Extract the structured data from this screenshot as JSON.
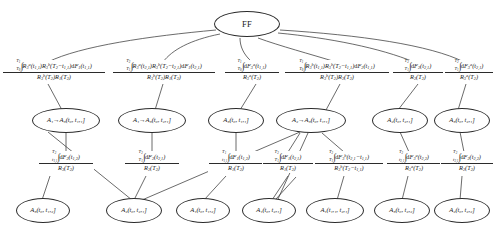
{
  "diagram": {
    "title": "FF",
    "type": "fault-tree",
    "canvas": {
      "width": 494,
      "height": 234
    },
    "colors": {
      "stroke": "#2b2b2b",
      "background": "#ffffff",
      "text": "#1a1a1a"
    },
    "root": {
      "id": "FF",
      "label": "FF",
      "x": 247,
      "y": 24,
      "w": 66,
      "h": 26
    },
    "nodes": [
      {
        "id": "n1",
        "label": "A₁→A₃(t₀, t₁,₁]",
        "x": 66,
        "y": 120,
        "w": 68,
        "h": 25,
        "row": "middle"
      },
      {
        "id": "n2",
        "label": "A₁→A₃(t₀, t₂,₁]",
        "x": 152,
        "y": 120,
        "w": 68,
        "h": 25,
        "row": "middle"
      },
      {
        "id": "n3",
        "label": "A₃(t₀, t₁,₁]",
        "x": 234,
        "y": 120,
        "w": 52,
        "h": 25,
        "row": "middle"
      },
      {
        "id": "n4",
        "label": "A₂→A₃(t₀, t₁,₁]",
        "x": 320,
        "y": 120,
        "w": 68,
        "h": 25,
        "row": "middle"
      },
      {
        "id": "n5",
        "label": "A₂(t₀, t₂,₁]",
        "x": 394,
        "y": 120,
        "w": 50,
        "h": 25,
        "row": "middle"
      },
      {
        "id": "n6",
        "label": "A₃(t₀, t₂,₁]",
        "x": 456,
        "y": 120,
        "w": 50,
        "h": 25,
        "row": "middle"
      },
      {
        "id": "b1",
        "label": "A₃(t₀, t₁,₂]",
        "x": 40,
        "y": 210,
        "w": 52,
        "h": 25,
        "row": "bottom"
      },
      {
        "id": "b2",
        "label": "A₂(t₀, t₂,₁]",
        "x": 130,
        "y": 210,
        "w": 52,
        "h": 25,
        "row": "bottom"
      },
      {
        "id": "b3",
        "label": "A₁(t₀, t₁,₂]",
        "x": 200,
        "y": 210,
        "w": 52,
        "h": 25,
        "row": "bottom"
      },
      {
        "id": "b4",
        "label": "A₁(t₀, t₂,₁]",
        "x": 268,
        "y": 210,
        "w": 52,
        "h": 25,
        "row": "bottom"
      },
      {
        "id": "b5",
        "label": "A₁(t₁,₁, t₂,₁]",
        "x": 335,
        "y": 210,
        "w": 56,
        "h": 25,
        "row": "bottom"
      },
      {
        "id": "b6",
        "label": "A₃(t₀, t₂,₂]",
        "x": 400,
        "y": 210,
        "w": 52,
        "h": 25,
        "row": "bottom"
      },
      {
        "id": "b7",
        "label": "A₂(t₀, t₂,₂]",
        "x": 460,
        "y": 210,
        "w": 52,
        "h": 25,
        "row": "bottom"
      }
    ],
    "edge_labels_top": [
      {
        "id": "f1",
        "numerator": "∫_{T₀}^{t_{T₁}} R₃ᵃ(t₁,₁) R₃ᵇ(T₂−t₁,₁) dF₁(t₁,₁)",
        "denominator": "R₃ᵇ(T₂) R₁(T₂)",
        "x": 48,
        "y": 73
      },
      {
        "id": "f2",
        "numerator": "∫_{T₁}^{T₂} R₃ᵃ(t₂,₁) R₃ᵇ(T₂−t₂,₁) dF₁(t₂,₁)",
        "denominator": "R₃ᵇ(T₂) R₁(T₂)",
        "x": 163,
        "y": 73
      },
      {
        "id": "f3",
        "numerator": "∫_{T₀}^{T₁} dF₃ᵃ(t₁,₁)",
        "denominator": "R₃ᵃ(T₂)",
        "x": 256,
        "y": 73
      },
      {
        "id": "f4",
        "numerator": "∫_{T₀}^{T₁} R₃ᵇ(t₁,₁) R₃ᵇ(T₂−t₁,₁) dF₂(t₁,₁)",
        "denominator": "R₃ᵇ(T₂) R₂(T₂)",
        "x": 340,
        "y": 73
      },
      {
        "id": "f5",
        "numerator": "∫_{T₁}^{T₂} dF₂(t₂,₁)",
        "denominator": "R₂(T₂)",
        "x": 418,
        "y": 73
      },
      {
        "id": "f6",
        "numerator": "∫_{T₁}^{T₂} dF₃ᵃ(t₂,₁)",
        "denominator": "R₃ᵃ(T₂)",
        "x": 466,
        "y": 73
      }
    ],
    "edge_labels_middle": [
      {
        "id": "g1",
        "numerator": "∫_{t₁,₁}^{T₂} dF₂(t₁,₂)",
        "denominator": "R₃(T₂)",
        "x": 66,
        "y": 163
      },
      {
        "id": "g2",
        "numerator": "∫_{T₁}^{T₂} dF₂(t₂,₁)",
        "denominator": "R₂(T₂)",
        "x": 152,
        "y": 163
      },
      {
        "id": "g3",
        "numerator": "∫_{t₁,₁}^{T₁} dF₁(t₁,₂)",
        "denominator": "R₁(T₂)",
        "x": 234,
        "y": 163
      },
      {
        "id": "g4",
        "numerator": "∫_{T₁}^{T₂} dF₁(t₂,₁)",
        "denominator": "R₁(T₂)",
        "x": 286,
        "y": 163
      },
      {
        "id": "g5",
        "numerator": "∫_{T₁}^{T₂} dF₃ᵇ(t₂,₁−t₁,₁)",
        "denominator": "R₃ᵇ(T₂−t₁,₁)",
        "x": 344,
        "y": 163
      },
      {
        "id": "g6",
        "numerator": "∫_{t₂,₁}^{T₂} dF₃ᵃ(t₂,₂)",
        "denominator": "R₃ᵃ(T₂)",
        "x": 412,
        "y": 163
      },
      {
        "id": "g7",
        "numerator": "∫_{t₂,₁}^{T₂} dF₂(t₂,₂)",
        "denominator": "R₂(T₂)",
        "x": 464,
        "y": 163
      }
    ]
  }
}
